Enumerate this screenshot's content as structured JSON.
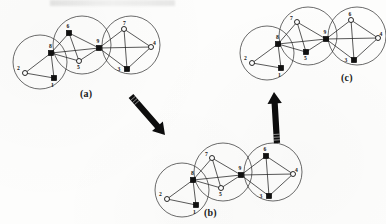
{
  "figure": {
    "background_color": "#fdfdfc",
    "ink_color": "#141414",
    "cluster_stroke_color": "#3a3a3a",
    "node_fill_square": "#111111",
    "node_fill_circle": "#ffffff"
  },
  "panels": [
    {
      "id": "a",
      "label": "(a)",
      "label_pos": {
        "x": 80,
        "y": 88
      },
      "clusters": [
        {
          "cx": 40,
          "cy": 62,
          "r": 27
        },
        {
          "cx": 82,
          "cy": 45,
          "r": 29
        },
        {
          "cx": 131,
          "cy": 45,
          "r": 29
        }
      ],
      "nodes": [
        {
          "id": "1",
          "shape": "square",
          "x": 54,
          "y": 78,
          "label_dx": -1.5,
          "label_dy": 8.5
        },
        {
          "id": "2",
          "shape": "circle",
          "x": 25,
          "y": 73,
          "label_dx": -6.5,
          "label_dy": -3.5
        },
        {
          "id": "8",
          "shape": "square",
          "x": 51,
          "y": 53,
          "label_dx": -0.5,
          "label_dy": -5.0
        },
        {
          "id": "6",
          "shape": "square",
          "x": 69,
          "y": 33,
          "label_dx": -1.0,
          "label_dy": -5.0
        },
        {
          "id": "5",
          "shape": "circle",
          "x": 79,
          "y": 61,
          "label_dx": -0.5,
          "label_dy": 7.5
        },
        {
          "id": "9",
          "shape": "square",
          "x": 99,
          "y": 48,
          "label_dx": -1.0,
          "label_dy": -5.5
        },
        {
          "id": "7",
          "shape": "circle",
          "x": 124,
          "y": 29,
          "label_dx": 0.5,
          "label_dy": -4.5
        },
        {
          "id": "4",
          "shape": "circle",
          "x": 151,
          "y": 47,
          "label_dx": 3.5,
          "label_dy": -2.0
        },
        {
          "id": "3",
          "shape": "square",
          "x": 127,
          "y": 69,
          "label_dx": -8.0,
          "label_dy": 1.5
        }
      ],
      "edges": [
        [
          "2",
          "1"
        ],
        [
          "2",
          "8"
        ],
        [
          "8",
          "1"
        ],
        [
          "8",
          "6"
        ],
        [
          "8",
          "5"
        ],
        [
          "8",
          "9"
        ],
        [
          "6",
          "5"
        ],
        [
          "6",
          "9"
        ],
        [
          "5",
          "9"
        ],
        [
          "9",
          "7"
        ],
        [
          "9",
          "3"
        ],
        [
          "9",
          "4"
        ],
        [
          "7",
          "4"
        ],
        [
          "7",
          "3"
        ],
        [
          "3",
          "4"
        ]
      ]
    },
    {
      "id": "b",
      "label": "(b)",
      "label_pos": {
        "x": 204,
        "y": 207
      },
      "clusters": [
        {
          "cx": 182,
          "cy": 190,
          "r": 27
        },
        {
          "cx": 223,
          "cy": 172,
          "r": 29
        },
        {
          "cx": 273,
          "cy": 172,
          "r": 29
        }
      ],
      "nodes": [
        {
          "id": "1",
          "shape": "square",
          "x": 196,
          "y": 205,
          "label_dx": -1.5,
          "label_dy": 8.5
        },
        {
          "id": "2",
          "shape": "circle",
          "x": 167,
          "y": 199,
          "label_dx": -6.5,
          "label_dy": -3.5
        },
        {
          "id": "8",
          "shape": "square",
          "x": 193,
          "y": 180,
          "label_dx": -0.5,
          "label_dy": -5.0
        },
        {
          "id": "7",
          "shape": "circle",
          "x": 212,
          "y": 158,
          "label_dx": -5.5,
          "label_dy": -2.0
        },
        {
          "id": "5",
          "shape": "circle",
          "x": 221,
          "y": 188,
          "label_dx": -0.5,
          "label_dy": 7.5
        },
        {
          "id": "9",
          "shape": "square",
          "x": 241,
          "y": 175,
          "label_dx": -1.0,
          "label_dy": -5.5
        },
        {
          "id": "6",
          "shape": "square",
          "x": 266,
          "y": 156,
          "label_dx": -1.0,
          "label_dy": -5.0
        },
        {
          "id": "4",
          "shape": "circle",
          "x": 293,
          "y": 174,
          "label_dx": 3.5,
          "label_dy": -2.0
        },
        {
          "id": "3",
          "shape": "square",
          "x": 269,
          "y": 196,
          "label_dx": -8.0,
          "label_dy": 1.5
        }
      ],
      "edges": [
        [
          "2",
          "1"
        ],
        [
          "2",
          "8"
        ],
        [
          "8",
          "1"
        ],
        [
          "8",
          "7"
        ],
        [
          "8",
          "5"
        ],
        [
          "8",
          "9"
        ],
        [
          "7",
          "5"
        ],
        [
          "7",
          "9"
        ],
        [
          "5",
          "9"
        ],
        [
          "9",
          "6"
        ],
        [
          "9",
          "3"
        ],
        [
          "9",
          "4"
        ],
        [
          "6",
          "4"
        ],
        [
          "6",
          "3"
        ],
        [
          "3",
          "4"
        ]
      ]
    },
    {
      "id": "c",
      "label": "(c)",
      "label_pos": {
        "x": 341,
        "y": 72
      },
      "clusters": [
        {
          "cx": 267,
          "cy": 53,
          "r": 27
        },
        {
          "cx": 308,
          "cy": 36,
          "r": 29
        },
        {
          "cx": 357,
          "cy": 36,
          "r": 29
        }
      ],
      "nodes": [
        {
          "id": "1",
          "shape": "square",
          "x": 281,
          "y": 68,
          "label_dx": -1.5,
          "label_dy": 8.5
        },
        {
          "id": "2",
          "shape": "circle",
          "x": 252,
          "y": 63,
          "label_dx": -6.5,
          "label_dy": -3.5
        },
        {
          "id": "8",
          "shape": "square",
          "x": 278,
          "y": 44,
          "label_dx": -0.5,
          "label_dy": -5.0
        },
        {
          "id": "7",
          "shape": "circle",
          "x": 297,
          "y": 22,
          "label_dx": -5.5,
          "label_dy": -2.0
        },
        {
          "id": "5",
          "shape": "square",
          "x": 306,
          "y": 52,
          "label_dx": -0.5,
          "label_dy": 7.5
        },
        {
          "id": "9",
          "shape": "square",
          "x": 326,
          "y": 39,
          "label_dx": -1.0,
          "label_dy": -5.5
        },
        {
          "id": "6",
          "shape": "circle",
          "x": 351,
          "y": 20,
          "label_dx": -1.0,
          "label_dy": -4.5
        },
        {
          "id": "4",
          "shape": "circle",
          "x": 378,
          "y": 38,
          "label_dx": 3.0,
          "label_dy": -2.0
        },
        {
          "id": "3",
          "shape": "square",
          "x": 354,
          "y": 60,
          "label_dx": -8.0,
          "label_dy": 1.5
        }
      ],
      "edges": [
        [
          "2",
          "1"
        ],
        [
          "2",
          "8"
        ],
        [
          "8",
          "1"
        ],
        [
          "8",
          "7"
        ],
        [
          "8",
          "5"
        ],
        [
          "8",
          "9"
        ],
        [
          "7",
          "5"
        ],
        [
          "7",
          "9"
        ],
        [
          "5",
          "9"
        ],
        [
          "9",
          "6"
        ],
        [
          "9",
          "3"
        ],
        [
          "9",
          "4"
        ],
        [
          "6",
          "4"
        ],
        [
          "6",
          "3"
        ],
        [
          "3",
          "4"
        ]
      ]
    }
  ],
  "arrows": [
    {
      "id": "arrow-a-to-b",
      "direction": "down-right",
      "from": {
        "x": 131,
        "y": 96
      },
      "to": {
        "x": 165,
        "y": 135
      }
    },
    {
      "id": "arrow-b-to-c",
      "direction": "up",
      "from": {
        "x": 277,
        "y": 143
      },
      "to": {
        "x": 274,
        "y": 92
      }
    }
  ]
}
